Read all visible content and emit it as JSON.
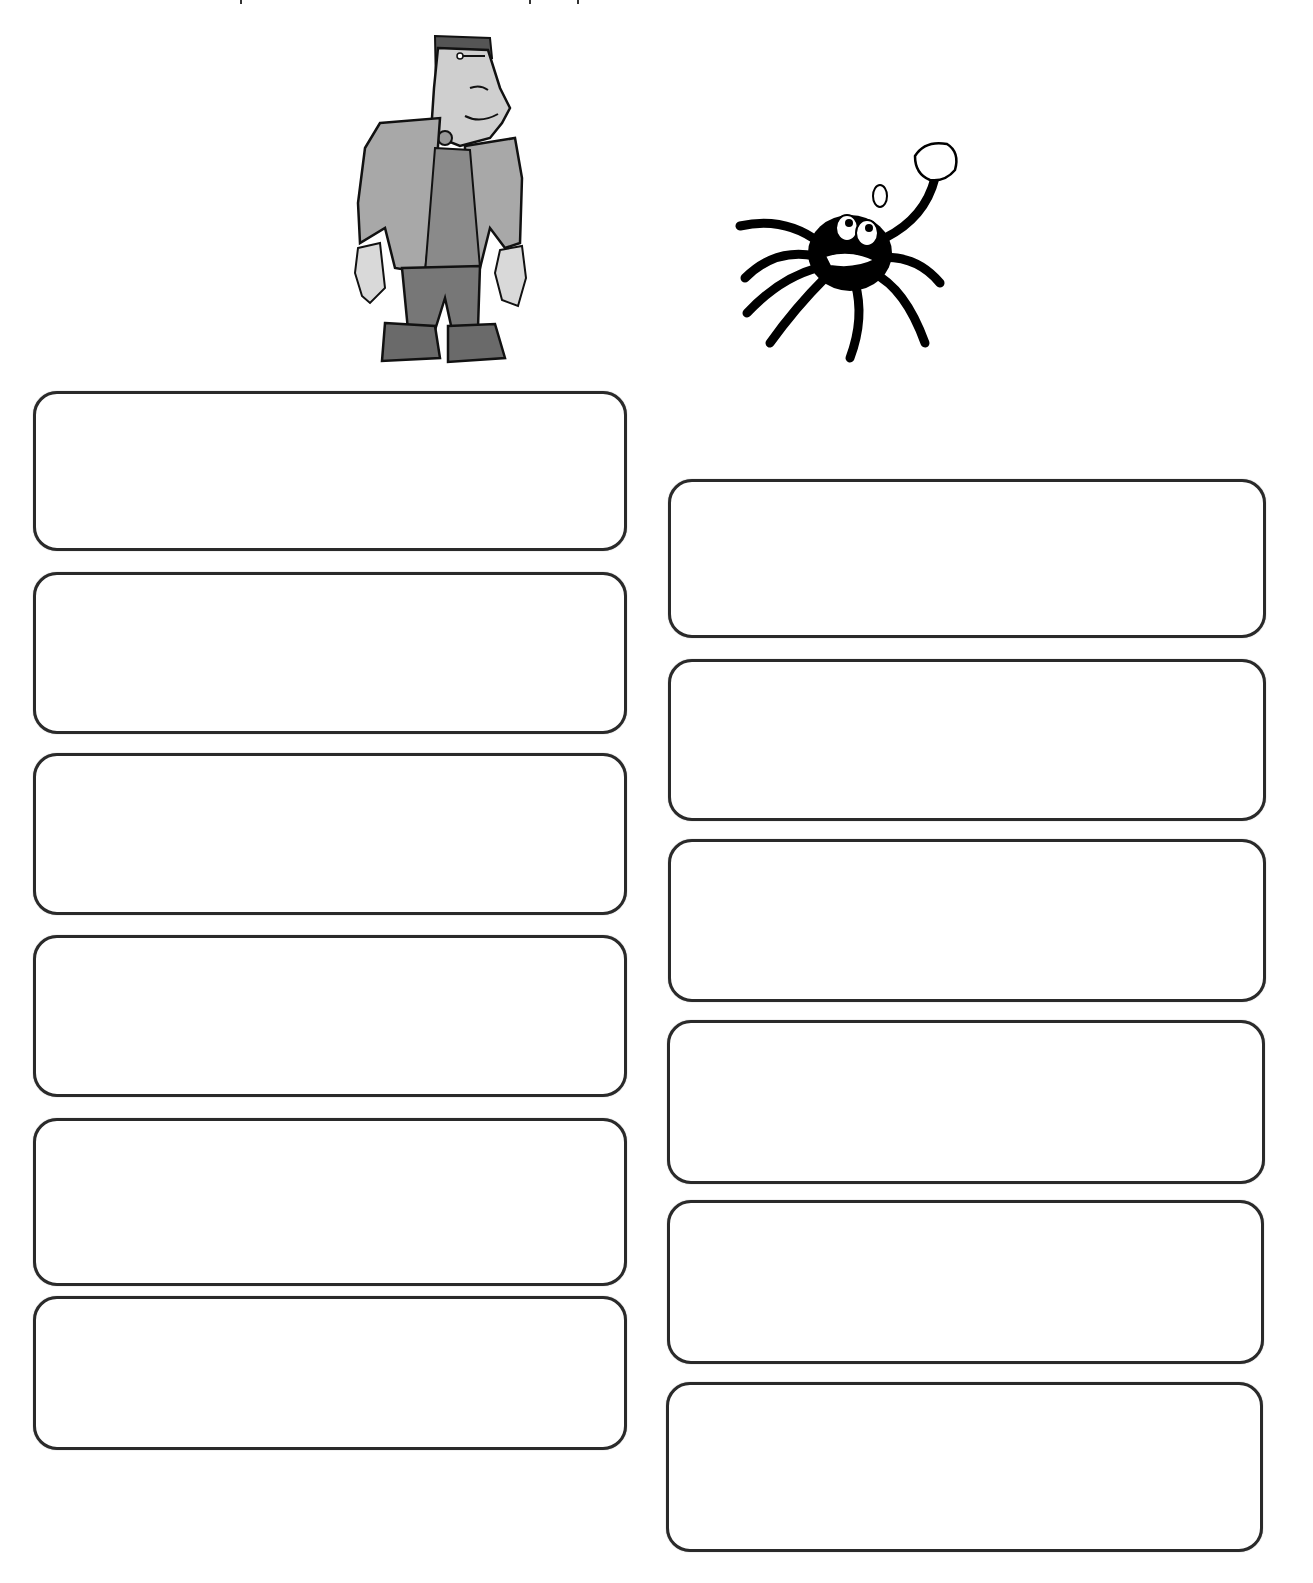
{
  "page": {
    "background": "#ffffff",
    "border_color": "#2a2a2a"
  },
  "illustrations": {
    "left": {
      "name": "frankenstein-monster",
      "description": "Cartoon Frankenstein's monster in a grey jacket and platform boots"
    },
    "right": {
      "name": "cartoon-spider",
      "description": "Black hairy cartoon spider waving with a gloved hand"
    }
  },
  "columns": {
    "left": {
      "label": "frankenstein-column",
      "boxes": [
        {
          "value": "",
          "placeholder": ""
        },
        {
          "value": "",
          "placeholder": ""
        },
        {
          "value": "",
          "placeholder": ""
        },
        {
          "value": "",
          "placeholder": ""
        },
        {
          "value": "",
          "placeholder": ""
        },
        {
          "value": "",
          "placeholder": ""
        }
      ]
    },
    "right": {
      "label": "spider-column",
      "boxes": [
        {
          "value": "",
          "placeholder": ""
        },
        {
          "value": "",
          "placeholder": ""
        },
        {
          "value": "",
          "placeholder": ""
        },
        {
          "value": "",
          "placeholder": ""
        },
        {
          "value": "",
          "placeholder": ""
        },
        {
          "value": "",
          "placeholder": ""
        }
      ]
    }
  }
}
